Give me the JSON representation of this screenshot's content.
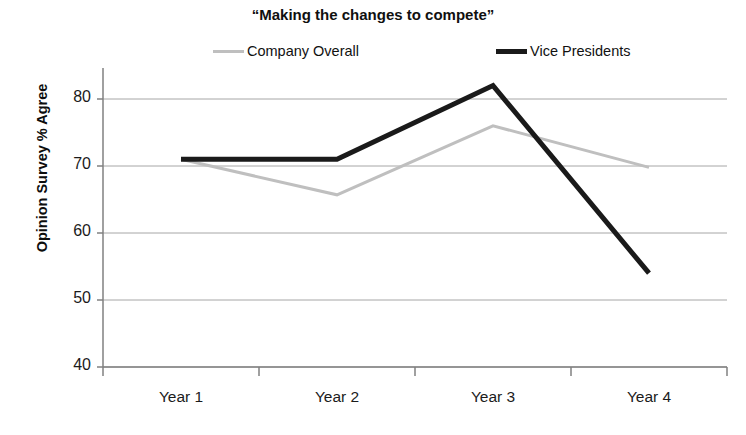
{
  "chart_data": {
    "type": "line",
    "title": "“Making the changes to compete”",
    "xlabel": "",
    "ylabel": "Opinion Survey % Agree",
    "categories": [
      "Year 1",
      "Year 2",
      "Year 3",
      "Year 4"
    ],
    "ylim": [
      40,
      85
    ],
    "yticks": [
      40,
      50,
      60,
      70,
      80
    ],
    "ytick_labels": [
      "40",
      "50",
      "60",
      "70",
      "80"
    ],
    "grid": true,
    "grid_axis": "y",
    "legend_position": "top",
    "series": [
      {
        "name": "Company Overall",
        "values": [
          71,
          65.7,
          76,
          69.8
        ],
        "color": "#bfbfbf",
        "line_width": 3
      },
      {
        "name": "Vice Presidents",
        "values": [
          71,
          71,
          82,
          54
        ],
        "color": "#1a1a1a",
        "line_width": 5
      }
    ]
  },
  "axis": {
    "line_color": "#808080",
    "grid_color": "#a6a6a6"
  }
}
